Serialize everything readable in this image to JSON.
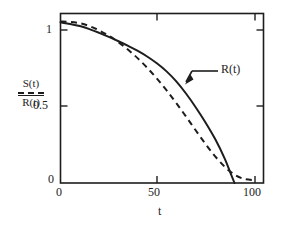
{
  "figure": {
    "background": "#ffffff",
    "line_color": "#1d1d1d"
  },
  "axes": {
    "x_title": "t",
    "y_numerator": "S(t)",
    "y_denominator": "R(t)",
    "x_ticks": [
      "0",
      "50",
      "100"
    ],
    "y_ticks": [
      "0",
      "0.5",
      "1"
    ]
  },
  "annotations": {
    "curve_label": "R(t)"
  },
  "chart_data": {
    "type": "line",
    "title": "",
    "xlabel": "t",
    "ylabel": "S(t)/R(t)",
    "xlim": [
      0,
      105
    ],
    "ylim": [
      0,
      1.05
    ],
    "xticks": [
      0,
      50,
      100
    ],
    "yticks": [
      0,
      0.5,
      1
    ],
    "grid": false,
    "legend": "none",
    "annotations": [
      {
        "text": "R(t)",
        "points_to_series": "R(t)",
        "text_x": 100,
        "text_y": 0.68,
        "arrow_tip_x": 66,
        "arrow_tip_y": 0.595
      }
    ],
    "series": [
      {
        "name": "R(t)",
        "style": "solid",
        "color": "#1d1d1d",
        "x": [
          0,
          5,
          10,
          15,
          20,
          25,
          30,
          35,
          40,
          45,
          50,
          55,
          60,
          65,
          70,
          75,
          80,
          85,
          88,
          90
        ],
        "y": [
          0.995,
          0.985,
          0.972,
          0.953,
          0.93,
          0.905,
          0.878,
          0.849,
          0.818,
          0.782,
          0.74,
          0.69,
          0.628,
          0.553,
          0.468,
          0.375,
          0.272,
          0.15,
          0.06,
          0.0
        ]
      },
      {
        "name": "S(t)",
        "style": "dashed",
        "color": "#1d1d1d",
        "x": [
          0,
          5,
          10,
          15,
          20,
          25,
          30,
          35,
          40,
          45,
          50,
          55,
          60,
          65,
          70,
          75,
          80,
          85,
          90,
          95,
          100
        ],
        "y": [
          1.0,
          0.998,
          0.99,
          0.972,
          0.945,
          0.912,
          0.872,
          0.825,
          0.772,
          0.712,
          0.645,
          0.572,
          0.493,
          0.41,
          0.325,
          0.242,
          0.165,
          0.1,
          0.052,
          0.025,
          0.018
        ]
      }
    ]
  }
}
